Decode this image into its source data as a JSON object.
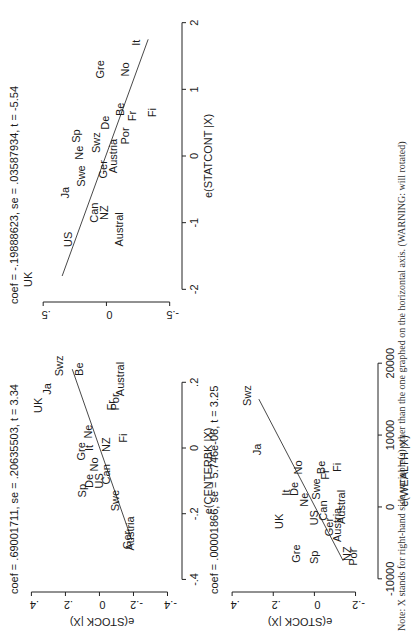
{
  "chart_data": [
    {
      "type": "scatter",
      "panel": "top-left",
      "title": "coef = .69001711, se = .20635503, t = 3.34",
      "xlabel": "e(CENTERBK |X)",
      "ylabel": "e(STOCK |X)",
      "xlim": [
        -0.42,
        0.28
      ],
      "ylim": [
        -0.45,
        0.42
      ],
      "xticks": [
        -0.4,
        -0.2,
        0,
        0.2
      ],
      "xtick_labels": [
        "-.4",
        "-.2",
        "0",
        ".2"
      ],
      "yticks": [
        -0.4,
        -0.2,
        0,
        0.2,
        0.4
      ],
      "ytick_labels": [
        "-.4",
        "-.2",
        "0",
        ".2",
        ".4"
      ],
      "fit_line": {
        "x": [
          -0.28,
          0.24
        ],
        "y": [
          -0.19,
          0.16
        ]
      },
      "points": [
        {
          "label": "UK",
          "x": 0.13,
          "y": 0.36
        },
        {
          "label": "Ja",
          "x": 0.18,
          "y": 0.31
        },
        {
          "label": "Swz",
          "x": 0.25,
          "y": 0.24
        },
        {
          "label": "Be",
          "x": 0.24,
          "y": 0.12
        },
        {
          "label": "Fr",
          "x": 0.13,
          "y": -0.07
        },
        {
          "label": "Por",
          "x": 0.14,
          "y": -0.09
        },
        {
          "label": "Austral",
          "x": 0.21,
          "y": -0.12
        },
        {
          "label": "Gre",
          "x": -0.01,
          "y": 0.11
        },
        {
          "label": "It",
          "x": 0.0,
          "y": 0.06
        },
        {
          "label": "Ne",
          "x": 0.05,
          "y": 0.07
        },
        {
          "label": "NZ",
          "x": 0.01,
          "y": -0.04
        },
        {
          "label": "Fi",
          "x": 0.03,
          "y": -0.14
        },
        {
          "label": "Sp",
          "x": -0.13,
          "y": 0.1
        },
        {
          "label": "De",
          "x": -0.1,
          "y": 0.06
        },
        {
          "label": "No",
          "x": -0.05,
          "y": 0.03
        },
        {
          "label": "US",
          "x": -0.1,
          "y": 0.0
        },
        {
          "label": "Can",
          "x": -0.08,
          "y": -0.04
        },
        {
          "label": "Swe",
          "x": -0.16,
          "y": -0.09
        },
        {
          "label": "Ger",
          "x": -0.28,
          "y": -0.16
        },
        {
          "label": "Austria",
          "x": -0.26,
          "y": -0.18
        }
      ]
    },
    {
      "type": "scatter",
      "panel": "bottom-left",
      "title": "coef = .00001866, se = 5.746e-06, t = 3.25",
      "xlabel": "e(WEALTH |X)",
      "ylabel": "e(STOCK |X)",
      "xlim": [
        -11000,
        21000
      ],
      "ylim": [
        -0.28,
        0.42
      ],
      "xticks": [
        -10000,
        0,
        10000,
        20000
      ],
      "xtick_labels": [
        "-10000",
        "0",
        "10000",
        "20000"
      ],
      "yticks": [
        -0.2,
        0,
        0.2,
        0.4
      ],
      "ytick_labels": [
        "-.2",
        "0",
        ".2",
        ".4"
      ],
      "fit_line": {
        "x": [
          -7500,
          15000
        ],
        "y": [
          -0.14,
          0.27
        ]
      },
      "points": [
        {
          "label": "Swz",
          "x": 15500,
          "y": 0.33
        },
        {
          "label": "Ja",
          "x": 8000,
          "y": 0.28
        },
        {
          "label": "It",
          "x": 2000,
          "y": 0.14
        },
        {
          "label": "De",
          "x": 2500,
          "y": 0.1
        },
        {
          "label": "No",
          "x": 5500,
          "y": 0.08
        },
        {
          "label": "Ne",
          "x": 1000,
          "y": 0.05
        },
        {
          "label": "UK",
          "x": -2000,
          "y": 0.17
        },
        {
          "label": "Be",
          "x": 5500,
          "y": -0.03
        },
        {
          "label": "Swe",
          "x": 2500,
          "y": -0.01
        },
        {
          "label": "Fr",
          "x": 4500,
          "y": -0.05
        },
        {
          "label": "Fi",
          "x": 5500,
          "y": -0.11
        },
        {
          "label": "US",
          "x": -1500,
          "y": 0.0
        },
        {
          "label": "Can",
          "x": -500,
          "y": -0.04
        },
        {
          "label": "Austral",
          "x": 0,
          "y": -0.13
        },
        {
          "label": "Ger",
          "x": -2800,
          "y": -0.07
        },
        {
          "label": "Austria",
          "x": -2500,
          "y": -0.11
        },
        {
          "label": "Gre",
          "x": -6500,
          "y": 0.09
        },
        {
          "label": "Sp",
          "x": -7000,
          "y": 0.0
        },
        {
          "label": "NZ",
          "x": -6500,
          "y": -0.16
        },
        {
          "label": "Por",
          "x": -7000,
          "y": -0.19
        }
      ]
    },
    {
      "type": "scatter",
      "panel": "top-right",
      "title": "coef = -.19888623, se = .03587934, t = -5.54",
      "xlabel": "e(STATCONT |X)",
      "ylabel": "",
      "xlim": [
        -2.1,
        2.1
      ],
      "ylim": [
        -0.55,
        0.62
      ],
      "xticks": [
        -2,
        -1,
        0,
        1,
        2
      ],
      "xtick_labels": [
        "-2",
        "-1",
        "0",
        "1",
        "2"
      ],
      "yticks": [
        -0.5,
        0,
        0.5
      ],
      "ytick_labels": [
        "-.5",
        "0",
        ".5"
      ],
      "fit_line": {
        "x": [
          -1.8,
          1.75
        ],
        "y": [
          0.35,
          -0.33
        ]
      },
      "points": [
        {
          "label": "UK",
          "x": -1.85,
          "y": 0.62
        },
        {
          "label": "US",
          "x": -1.25,
          "y": 0.3
        },
        {
          "label": "Ja",
          "x": -0.55,
          "y": 0.33
        },
        {
          "label": "Can",
          "x": -0.85,
          "y": 0.1
        },
        {
          "label": "NZ",
          "x": -0.85,
          "y": 0.02
        },
        {
          "label": "Austral",
          "x": -1.1,
          "y": -0.1
        },
        {
          "label": "Swe",
          "x": -0.3,
          "y": 0.2
        },
        {
          "label": "Ne",
          "x": 0.05,
          "y": 0.22
        },
        {
          "label": "Sp",
          "x": 0.3,
          "y": 0.24
        },
        {
          "label": "Ger",
          "x": -0.2,
          "y": 0.03
        },
        {
          "label": "Swz",
          "x": 0.2,
          "y": 0.08
        },
        {
          "label": "De",
          "x": 0.5,
          "y": 0.01
        },
        {
          "label": "Austria",
          "x": 0.0,
          "y": -0.05
        },
        {
          "label": "Por",
          "x": 0.3,
          "y": -0.15
        },
        {
          "label": "Be",
          "x": 0.7,
          "y": -0.11
        },
        {
          "label": "Fr",
          "x": 0.6,
          "y": -0.2
        },
        {
          "label": "Fi",
          "x": 0.65,
          "y": -0.36
        },
        {
          "label": "Gre",
          "x": 1.3,
          "y": 0.05
        },
        {
          "label": "No",
          "x": 1.3,
          "y": -0.15
        },
        {
          "label": "It",
          "x": 1.7,
          "y": -0.23
        }
      ]
    }
  ],
  "note": "Note: X stands for right-hand side variable(s) other than the one graphed on the horizontal axis. (WARNING: will rotated)"
}
